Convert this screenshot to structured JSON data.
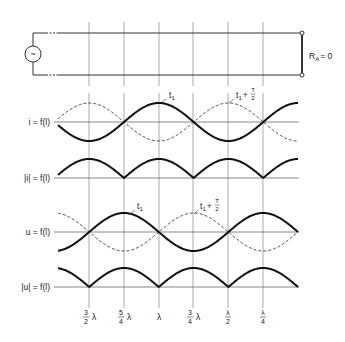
{
  "circuit": {
    "source_symbol": "~",
    "load_label_main": "R",
    "load_label_sub": "A",
    "load_label_value": "= 0"
  },
  "plots": [
    {
      "id": "i",
      "label": "i = f(l)",
      "axis_y": 122
    },
    {
      "id": "abs_i",
      "label": "|i| = f(l)",
      "axis_y": 178
    },
    {
      "id": "u",
      "label": "u = f(l)",
      "axis_y": 232
    },
    {
      "id": "abs_u",
      "label": "|u| = f(l)",
      "axis_y": 287
    }
  ],
  "annotations": {
    "i_t1": "t",
    "i_t1_sub": "1",
    "i_t1_half": "t",
    "i_t1_half_sub": "1",
    "i_t1_half_plus": "+",
    "i_half_num": "T",
    "i_half_den": "2",
    "u_t1": "t",
    "u_t1_sub": "1",
    "u_t1_half": "t",
    "u_t1_half_sub": "1",
    "u_t1_half_plus": "+",
    "u_half_num": "T",
    "u_half_den": "2"
  },
  "x_ticks": [
    {
      "num": "3",
      "den": "2",
      "suffix": "λ",
      "x": 89
    },
    {
      "num": "5",
      "den": "4",
      "suffix": "λ",
      "x": 124
    },
    {
      "num": "",
      "den": "",
      "suffix": "λ",
      "x": 159
    },
    {
      "num": "3",
      "den": "4",
      "suffix": "λ",
      "x": 193
    },
    {
      "num": "λ",
      "den": "2",
      "suffix": "",
      "x": 228
    },
    {
      "num": "λ",
      "den": "4",
      "suffix": "",
      "x": 263
    }
  ],
  "chart_data": {
    "type": "line",
    "xlabel": "distance from load l",
    "x_tick_labels": [
      "3/2 λ",
      "5/4 λ",
      "λ",
      "3/4 λ",
      "λ/2",
      "λ/4"
    ],
    "x_px": {
      "load": 298,
      "quarter_wave": 34.8,
      "start": 58
    },
    "amplitude_px": 19,
    "series": [
      {
        "name": "i at t1",
        "plot": "i",
        "style": "solid",
        "formula": "cos(2πl/λ)"
      },
      {
        "name": "i at t1 + T/2",
        "plot": "i",
        "style": "dashed",
        "formula": "-cos(2πl/λ)"
      },
      {
        "name": "|i|",
        "plot": "abs_i",
        "style": "solid",
        "formula": "|cos(2πl/λ)|"
      },
      {
        "name": "u at t1",
        "plot": "u",
        "style": "solid",
        "formula": "sin(2πl/λ)"
      },
      {
        "name": "u at t1 + T/2",
        "plot": "u",
        "style": "dashed",
        "formula": "-sin(2πl/λ)"
      },
      {
        "name": "|u|",
        "plot": "abs_u",
        "style": "solid",
        "formula": "|sin(2πl/λ)|"
      }
    ]
  }
}
